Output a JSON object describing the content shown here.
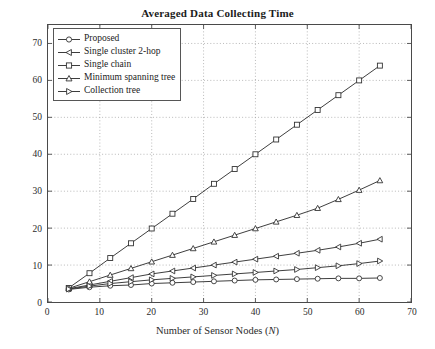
{
  "chart_data": {
    "type": "line",
    "title": "Averaged Data Collecting Time",
    "xlabel": "Number of Sensor Nodes (N)",
    "xlabel_plain": "Number of Sensor Nodes",
    "xlabel_symbol": "N",
    "ylabel": "Time Slots",
    "xlim": [
      0,
      70
    ],
    "ylim": [
      0,
      75
    ],
    "xticks": [
      0,
      10,
      20,
      30,
      40,
      50,
      60,
      70
    ],
    "yticks": [
      0,
      10,
      20,
      30,
      40,
      50,
      60,
      70
    ],
    "grid": "dotted",
    "legend_position": "top-left",
    "x": [
      4,
      8,
      12,
      16,
      20,
      24,
      28,
      32,
      36,
      40,
      44,
      48,
      52,
      56,
      60,
      64
    ],
    "series": [
      {
        "name": "Proposed",
        "marker": "circle",
        "color": "#333333",
        "values": [
          3.4,
          4.0,
          4.4,
          4.6,
          5.0,
          5.2,
          5.4,
          5.6,
          5.8,
          6.0,
          6.1,
          6.2,
          6.3,
          6.4,
          6.4,
          6.5
        ]
      },
      {
        "name": "Single cluster 2-hop",
        "marker": "triangle-left",
        "color": "#333333",
        "values": [
          3.6,
          4.6,
          5.6,
          6.6,
          7.6,
          8.4,
          9.2,
          10.0,
          10.8,
          11.6,
          12.4,
          13.2,
          14.0,
          14.9,
          15.9,
          17.0
        ]
      },
      {
        "name": "Single chain",
        "marker": "square",
        "color": "#333333",
        "values": [
          3.8,
          7.8,
          11.9,
          15.9,
          19.9,
          23.9,
          27.9,
          32.0,
          36.0,
          40.0,
          44.0,
          48.0,
          52.0,
          56.0,
          60.0,
          64.0
        ]
      },
      {
        "name": "Minimum spanning tree",
        "marker": "triangle-up",
        "color": "#333333",
        "values": [
          3.7,
          5.5,
          7.3,
          9.1,
          10.9,
          12.7,
          14.5,
          16.3,
          18.1,
          19.9,
          21.7,
          23.5,
          25.4,
          27.8,
          30.3,
          32.9
        ]
      },
      {
        "name": "Collection tree",
        "marker": "triangle-right",
        "color": "#333333",
        "values": [
          3.5,
          4.3,
          5.0,
          5.5,
          6.0,
          6.4,
          6.8,
          7.2,
          7.6,
          8.0,
          8.4,
          8.8,
          9.3,
          9.8,
          10.4,
          11.1
        ]
      }
    ]
  }
}
